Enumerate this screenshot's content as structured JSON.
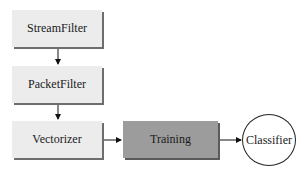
{
  "diagram": {
    "nodes": [
      {
        "id": "streamfilter",
        "label": "StreamFilter",
        "shape": "rectangle",
        "fill": "#ececec"
      },
      {
        "id": "packetfilter",
        "label": "PacketFilter",
        "shape": "rectangle",
        "fill": "#ececec"
      },
      {
        "id": "vectorizer",
        "label": "Vectorizer",
        "shape": "rectangle",
        "fill": "#ececec"
      },
      {
        "id": "training",
        "label": "Training",
        "shape": "rectangle",
        "fill": "#9c9c9c"
      },
      {
        "id": "classifier",
        "label": "Classifier",
        "shape": "circle",
        "fill": "#ffffff"
      }
    ],
    "edges": [
      {
        "from": "streamfilter",
        "to": "packetfilter"
      },
      {
        "from": "packetfilter",
        "to": "vectorizer"
      },
      {
        "from": "vectorizer",
        "to": "training"
      },
      {
        "from": "training",
        "to": "classifier"
      }
    ]
  }
}
